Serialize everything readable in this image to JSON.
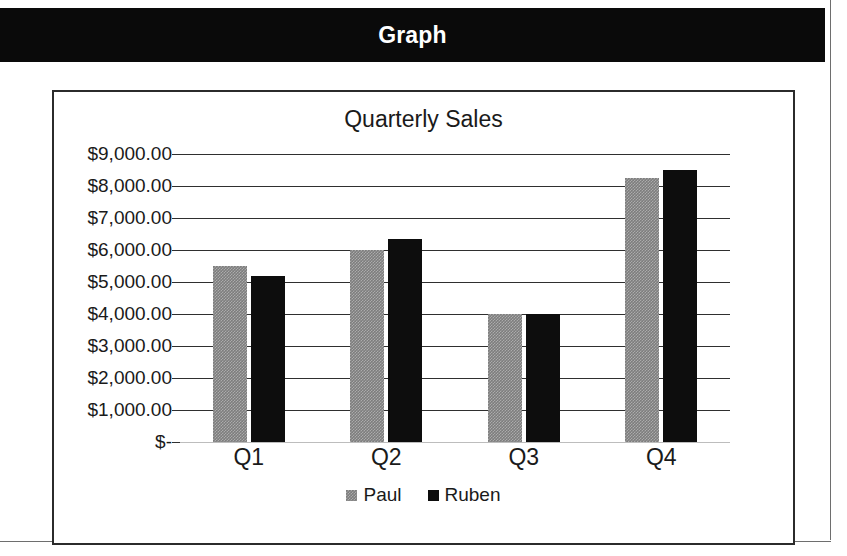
{
  "header": {
    "title": "Graph",
    "background_color": "#0a0a0a",
    "text_color": "#ffffff"
  },
  "chart_data": {
    "type": "bar",
    "title": "Quarterly Sales",
    "xlabel": "",
    "ylabel": "",
    "categories": [
      "Q1",
      "Q2",
      "Q3",
      "Q4"
    ],
    "series": [
      {
        "name": "Paul",
        "color": "#7d7d7d",
        "values": [
          5500,
          6000,
          4000,
          8250
        ]
      },
      {
        "name": "Ruben",
        "color": "#0d0d0d",
        "values": [
          5200,
          6350,
          4000,
          8500
        ]
      }
    ],
    "ylim": [
      0,
      9000
    ],
    "ytick_values": [
      9000,
      8000,
      7000,
      6000,
      5000,
      4000,
      3000,
      2000,
      1000,
      0
    ],
    "ytick_labels": [
      "$9,000.00",
      "$8,000.00",
      "$7,000.00",
      "$6,000.00",
      "$5,000.00",
      "$4,000.00",
      "$3,000.00",
      "$2,000.00",
      "$1,000.00",
      "$-"
    ],
    "grid": true,
    "legend_position": "bottom",
    "legend_entries": [
      "Paul",
      "Ruben"
    ]
  }
}
